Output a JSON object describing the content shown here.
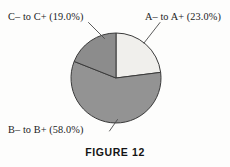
{
  "figure": {
    "caption": "FIGURE 12",
    "background_color": "#fdfdfc",
    "outline_color": "#3a3a3a"
  },
  "chart_data": {
    "type": "pie",
    "title": "FIGURE 12",
    "xlabel": "",
    "ylabel": "",
    "legend_position": "none",
    "grid": false,
    "labels": [
      "A– to A+ (23.0%)",
      "B– to B+ (58.0%)",
      "C– to C+ (19.0%)"
    ],
    "categories": [
      "A– to A+",
      "B– to B+",
      "C– to C+"
    ],
    "values": [
      23.0,
      58.0,
      19.0
    ],
    "units": "percent",
    "total": 100.0,
    "colors": [
      "#f0efec",
      "#939393",
      "#8c8c8c"
    ],
    "slices": [
      {
        "name": "A– to A+",
        "label": "A– to A+ (23.0%)",
        "value": 23.0,
        "percent_text": "23.0%",
        "color": "#f0efec",
        "start_angle_deg": 0.0,
        "end_angle_deg": 82.8
      },
      {
        "name": "B– to B+",
        "label": "B– to B+ (58.0%)",
        "value": 58.0,
        "percent_text": "58.0%",
        "color": "#939393",
        "start_angle_deg": 82.8,
        "end_angle_deg": 291.6
      },
      {
        "name": "C– to C+",
        "label": "C– to C+ (19.0%)",
        "value": 19.0,
        "percent_text": "19.0%",
        "color": "#8c8c8c",
        "start_angle_deg": 291.6,
        "end_angle_deg": 360.0
      }
    ]
  }
}
